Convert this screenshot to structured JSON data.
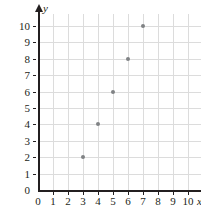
{
  "chart_data": {
    "type": "scatter",
    "title": "",
    "xlabel": "x",
    "ylabel": "y",
    "xlim": [
      0,
      10
    ],
    "ylim": [
      0,
      10
    ],
    "xticks": [
      0,
      1,
      2,
      3,
      4,
      5,
      6,
      7,
      8,
      9,
      10
    ],
    "yticks": [
      0,
      1,
      2,
      3,
      4,
      5,
      6,
      7,
      8,
      9,
      10
    ],
    "xtick_labels": [
      "0",
      "1",
      "2",
      "3",
      "4",
      "5",
      "6",
      "7",
      "8",
      "9",
      "10"
    ],
    "ytick_labels": [
      "0",
      "1",
      "2",
      "3",
      "4",
      "5",
      "6",
      "7",
      "8",
      "9",
      "10"
    ],
    "grid": true,
    "legend": false,
    "point_color": "#808285",
    "axis_color": "#231f20",
    "grid_color": "#dcdcdc",
    "background_color": "#ffffff",
    "points": [
      {
        "x": 3,
        "y": 2
      },
      {
        "x": 4,
        "y": 4
      },
      {
        "x": 5,
        "y": 6
      },
      {
        "x": 6,
        "y": 8
      },
      {
        "x": 7,
        "y": 10
      }
    ]
  }
}
